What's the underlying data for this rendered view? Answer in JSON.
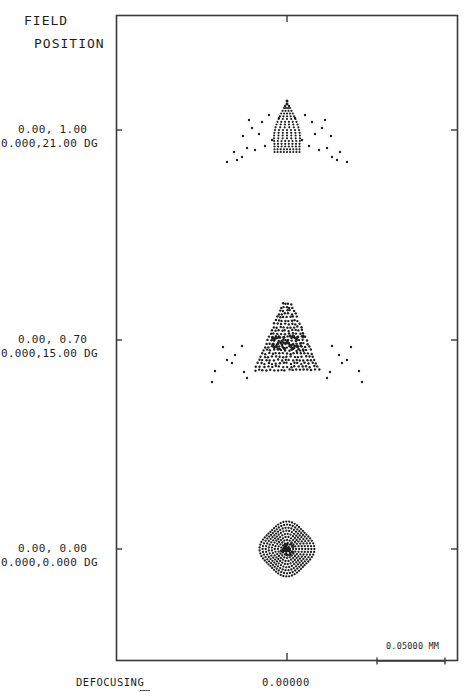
{
  "header": {
    "title_line1": "FIELD",
    "title_line2": "POSITION"
  },
  "fields": [
    {
      "line1": "0.00, 1.00",
      "line2": "0.000,21.00 DG",
      "label_y": 130
    },
    {
      "line1": "0.00, 0.70",
      "line2": "0.000,15.00 DG",
      "label_y": 340
    },
    {
      "line1": "0.00, 0.00",
      "line2": "0.000,0.000 DG",
      "label_y": 549
    }
  ],
  "scale_bar": {
    "label": "0.05000 MM"
  },
  "footer": {
    "defocus_label": "DEFOCUSING",
    "defocus_value": "0.00000"
  },
  "colors": {
    "ink": "#1e1e1e",
    "frame": "#3a3a3a",
    "background": "#ffffff"
  },
  "chart_data": {
    "type": "scatter",
    "subtype": "spot diagram",
    "xlabel": "DEFOCUSING",
    "x_tick_labels": [
      "0.00000"
    ],
    "scale_bar": "0.05000 MM",
    "grid": false,
    "series": [
      {
        "name": "0.00, 1.00 / 0.000,21.00 DG",
        "center_y_px": 130,
        "shape": "arrowhead / coma fan",
        "approx_width_mm": 0.14
      },
      {
        "name": "0.00, 0.70 / 0.000,15.00 DG",
        "center_y_px": 340,
        "shape": "triangular coma with wings",
        "approx_width_mm": 0.14
      },
      {
        "name": "0.00, 0.00 / 0.000,0.000 DG",
        "center_y_px": 549,
        "shape": "circular rosette",
        "approx_width_mm": 0.065
      }
    ]
  }
}
